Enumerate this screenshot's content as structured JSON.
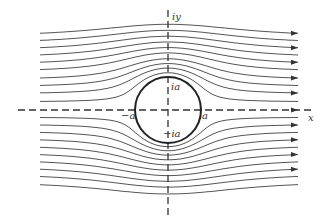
{
  "diagram": {
    "title": "",
    "type": "potential flow past a circular cylinder (streamlines)",
    "labels": {
      "y_axis": "iy",
      "x_axis": "x",
      "top": "ia",
      "bottom": "−ia",
      "left": "−a",
      "right": "a"
    },
    "geometry": {
      "center": [
        168,
        110
      ],
      "radius": 33,
      "x_start": 40,
      "x_end": 298,
      "axis_x_range": [
        18,
        312
      ],
      "axis_y_range": [
        10,
        215
      ]
    },
    "streamlines_far_offsets": [
      73,
      66,
      59,
      52,
      45,
      38,
      30,
      23,
      16,
      8,
      -7,
      -14,
      -21,
      -28,
      -35,
      -42,
      -49,
      -56,
      -63,
      -71
    ],
    "arrow_on": [
      true,
      false,
      true,
      false,
      true,
      false,
      true,
      false,
      true,
      false,
      false,
      true,
      false,
      true,
      false,
      true,
      false,
      true,
      false,
      false
    ],
    "colors": {
      "streamline": "#555555",
      "circle": "#222222",
      "axis": "#333333",
      "background": "#ffffff"
    }
  }
}
